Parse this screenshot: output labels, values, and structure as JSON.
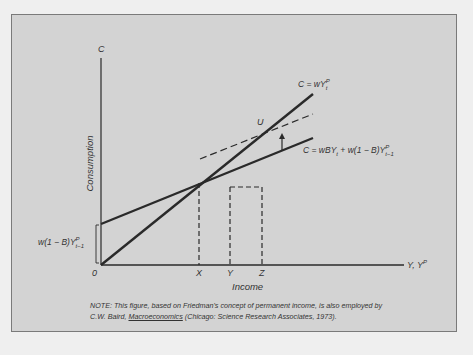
{
  "figure": {
    "axes": {
      "y_axis_symbol": "C",
      "y_axis_label": "Consumption",
      "x_axis_label": "Income",
      "x_axis_symbol_main": "Y, Y",
      "x_axis_symbol_sup": "P",
      "origin_label": "0",
      "x_ticks": [
        "X",
        "Y",
        "Z"
      ]
    },
    "lines": {
      "long_run": {
        "label_main": "C = wY",
        "label_sup": "P",
        "label_sub": "t"
      },
      "short_run": {
        "label_main": "C = wBY",
        "label_sub1": "t",
        "label_mid": " + w(1 − B)Y",
        "label_sup": "P",
        "label_sub2": "t−1"
      },
      "shifted_short_run": {
        "style": "dashed"
      }
    },
    "point_label": "U",
    "intercept_label": {
      "main": "w(1 − B)Y",
      "sup": "P",
      "sub": "t−1"
    },
    "note": {
      "line1": "NOTE:  This figure, based on Friedman's concept of permanent income, is also employed by",
      "line2_prefix": "C.W. Baird, ",
      "line2_title": "Macroeconomics",
      "line2_suffix": " (Chicago:  Science Research Associates, 1973)."
    }
  },
  "colors": {
    "page_bg": "#efefef",
    "panel_bg": "#d3d3d3",
    "panel_border": "#7a7a7a",
    "ink": "#2a2a2a"
  }
}
